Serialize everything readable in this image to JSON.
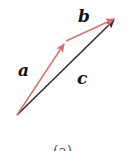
{
  "diagram": {
    "vectors": [
      {
        "name": "a",
        "from": [
          17,
          115
        ],
        "to": [
          65,
          42
        ],
        "color": "#d9706a"
      },
      {
        "name": "b",
        "from": [
          66,
          41
        ],
        "to": [
          116,
          18
        ],
        "color": "#d9706a"
      },
      {
        "name": "c",
        "from": [
          17,
          115
        ],
        "to": [
          116,
          18
        ],
        "color": "#2b2b2b"
      }
    ],
    "labels": {
      "a": "a",
      "b": "b",
      "c": "c"
    },
    "caption": "(a)"
  }
}
